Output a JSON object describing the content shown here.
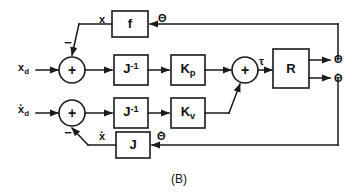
{
  "figure": {
    "caption": "(B)",
    "type": "control-system-block-diagram",
    "colors": {
      "line": "#1a1a1a",
      "background": "#ffffff",
      "text": "#111111"
    }
  },
  "inputs": [
    {
      "id": "xd",
      "label": "x",
      "subscript": "d",
      "dot": false,
      "row": "position"
    },
    {
      "id": "xd_dot",
      "label": "x",
      "subscript": "d",
      "dot": true,
      "row": "velocity"
    }
  ],
  "blocks": [
    {
      "id": "f",
      "label": "f",
      "superscript": "",
      "subscript": ""
    },
    {
      "id": "jinv_p",
      "label": "J",
      "superscript": "-1",
      "subscript": ""
    },
    {
      "id": "kp",
      "label": "K",
      "superscript": "",
      "subscript": "p"
    },
    {
      "id": "jinv_v",
      "label": "J",
      "superscript": "-1",
      "subscript": ""
    },
    {
      "id": "kv",
      "label": "K",
      "superscript": "",
      "subscript": "v"
    },
    {
      "id": "r",
      "label": "R",
      "superscript": "",
      "subscript": ""
    },
    {
      "id": "j",
      "label": "J",
      "superscript": "",
      "subscript": ""
    }
  ],
  "summing_junctions": [
    {
      "id": "sum_pos",
      "symbol": "+",
      "negative_sign": "−",
      "negative_port": "top"
    },
    {
      "id": "sum_vel",
      "symbol": "+",
      "negative_sign": "−",
      "negative_port": "bottom"
    },
    {
      "id": "sum_tau",
      "symbol": "+",
      "negative_sign": "",
      "negative_port": ""
    }
  ],
  "signals": {
    "x_feedback": "x",
    "x_dot_feedback": "x",
    "theta_top": "Θ",
    "theta_bottom": "Θ",
    "tau": "τ",
    "out_theta": "Θ",
    "out_theta_dot": "Θ"
  },
  "outputs": [
    {
      "id": "theta",
      "label": "Θ",
      "dot": false
    },
    {
      "id": "theta_dot",
      "label": "Θ",
      "dot": true
    }
  ]
}
